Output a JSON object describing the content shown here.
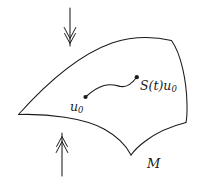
{
  "figure": {
    "kind": "math-diagram",
    "background_color": "#ffffff",
    "stroke_color": "#1a1a1a",
    "width": 198,
    "height": 180
  },
  "labels": {
    "start_point": {
      "text": "u",
      "subscript": "0",
      "full": "u0",
      "x": 70,
      "y": 101
    },
    "end_point": {
      "text": "S(t)u",
      "subscript": "0",
      "full": "S(t)u0",
      "x": 140,
      "y": 80
    },
    "manifold": {
      "text": "M",
      "full": "M",
      "x": 147,
      "y": 157
    }
  },
  "points": [
    {
      "name": "u0-dot",
      "x": 85,
      "y": 97
    },
    {
      "name": "stu0-dot",
      "x": 137,
      "y": 77
    }
  ],
  "arrows": [
    {
      "name": "top-inflow-arrow",
      "direction": "down",
      "head_style": "double-chevron",
      "x": 70,
      "y_start": 8,
      "y_end": 46
    },
    {
      "name": "bottom-inflow-arrow",
      "direction": "up",
      "head_style": "double-chevron",
      "x": 62,
      "y_start": 176,
      "y_end": 133
    }
  ],
  "shapes": {
    "manifold_outline": "quadrilateral patch, curved edges, V-shaped cusp on lower boundary",
    "trajectory": "S-shaped curve from u0 to S(t)u0"
  },
  "colors": {
    "ink": "#1a1a1a",
    "paper": "#ffffff"
  }
}
